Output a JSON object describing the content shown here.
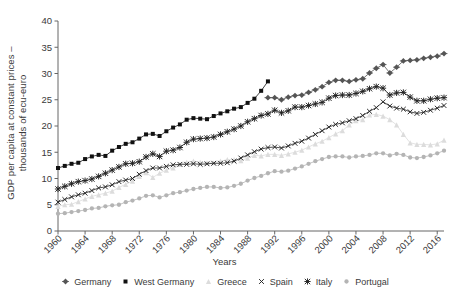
{
  "chart_data": {
    "type": "line",
    "title": "",
    "xlabel": "Years",
    "ylabel": "GDP per capita at constant prices – thousands of ecu-euro",
    "ylabel_line1": "GDP per capita at constant prices –",
    "ylabel_line2": "thousands of ecu-euro",
    "xlim": [
      1960,
      2017
    ],
    "ylim": [
      0,
      40
    ],
    "yticks": [
      0,
      5,
      10,
      15,
      20,
      25,
      30,
      35,
      40
    ],
    "xticks": [
      1960,
      1964,
      1968,
      1972,
      1976,
      1980,
      1984,
      1988,
      1992,
      1996,
      2000,
      2004,
      2008,
      2012,
      2016
    ],
    "grid": false,
    "legend_position": "bottom",
    "x": [
      1960,
      1961,
      1962,
      1963,
      1964,
      1965,
      1966,
      1967,
      1968,
      1969,
      1970,
      1971,
      1972,
      1973,
      1974,
      1975,
      1976,
      1977,
      1978,
      1979,
      1980,
      1981,
      1982,
      1983,
      1984,
      1985,
      1986,
      1987,
      1988,
      1989,
      1990,
      1991,
      1992,
      1993,
      1994,
      1995,
      1996,
      1997,
      1998,
      1999,
      2000,
      2001,
      2002,
      2003,
      2004,
      2005,
      2006,
      2007,
      2008,
      2009,
      2010,
      2011,
      2012,
      2013,
      2014,
      2015,
      2016,
      2017
    ],
    "series": [
      {
        "name": "Germany",
        "color": "#555555",
        "marker": "diamond",
        "x": [
          1991,
          1992,
          1993,
          1994,
          1995,
          1996,
          1997,
          1998,
          1999,
          2000,
          2001,
          2002,
          2003,
          2004,
          2005,
          2006,
          2007,
          2008,
          2009,
          2010,
          2011,
          2012,
          2013,
          2014,
          2015,
          2016,
          2017
        ],
        "values": [
          25.4,
          25.4,
          25.0,
          25.5,
          25.8,
          25.9,
          26.4,
          26.9,
          27.5,
          28.3,
          28.7,
          28.7,
          28.5,
          28.8,
          29.0,
          30.1,
          31.0,
          31.7,
          30.1,
          31.2,
          32.4,
          32.5,
          32.6,
          32.9,
          33.1,
          33.3,
          33.8
        ]
      },
      {
        "name": "West Germany",
        "color": "#111111",
        "marker": "square",
        "x": [
          1960,
          1961,
          1962,
          1963,
          1964,
          1965,
          1966,
          1967,
          1968,
          1969,
          1970,
          1971,
          1972,
          1973,
          1974,
          1975,
          1976,
          1977,
          1978,
          1979,
          1980,
          1981,
          1982,
          1983,
          1984,
          1985,
          1986,
          1987,
          1988,
          1989,
          1990,
          1991
        ],
        "values": [
          12.0,
          12.4,
          12.8,
          13.0,
          13.7,
          14.2,
          14.5,
          14.3,
          15.3,
          16.0,
          16.6,
          16.9,
          17.6,
          18.4,
          18.5,
          18.1,
          19.0,
          19.7,
          20.3,
          21.2,
          21.5,
          21.4,
          21.3,
          21.9,
          22.4,
          22.8,
          23.3,
          23.6,
          24.4,
          25.2,
          26.7,
          28.5
        ]
      },
      {
        "name": "Greece",
        "color": "#dcdcdc",
        "marker": "triangle",
        "x": [
          1960,
          1961,
          1962,
          1963,
          1964,
          1965,
          1966,
          1967,
          1968,
          1969,
          1970,
          1971,
          1972,
          1973,
          1974,
          1975,
          1976,
          1977,
          1978,
          1979,
          1980,
          1981,
          1982,
          1983,
          1984,
          1985,
          1986,
          1987,
          1988,
          1989,
          1990,
          1991,
          1992,
          1993,
          1994,
          1995,
          1996,
          1997,
          1998,
          1999,
          2000,
          2001,
          2002,
          2003,
          2004,
          2005,
          2006,
          2007,
          2008,
          2009,
          2010,
          2011,
          2012,
          2013,
          2014,
          2015,
          2016,
          2017
        ],
        "values": [
          4.7,
          5.0,
          5.1,
          5.6,
          6.1,
          6.6,
          6.9,
          7.2,
          7.6,
          8.3,
          8.9,
          9.5,
          10.4,
          11.1,
          10.2,
          11.0,
          11.6,
          12.0,
          12.7,
          13.1,
          13.3,
          13.1,
          13.0,
          13.0,
          13.3,
          13.6,
          13.6,
          13.4,
          13.9,
          14.4,
          14.3,
          14.6,
          14.6,
          14.4,
          14.7,
          15.0,
          15.4,
          16.0,
          16.6,
          17.1,
          17.8,
          18.5,
          19.1,
          20.2,
          21.0,
          21.2,
          22.1,
          22.2,
          21.9,
          21.2,
          20.2,
          18.4,
          16.8,
          16.5,
          16.5,
          16.4,
          16.6,
          17.3
        ]
      },
      {
        "name": "Spain",
        "color": "#222222",
        "marker": "x",
        "x": [
          1960,
          1961,
          1962,
          1963,
          1964,
          1965,
          1966,
          1967,
          1968,
          1969,
          1970,
          1971,
          1972,
          1973,
          1974,
          1975,
          1976,
          1977,
          1978,
          1979,
          1980,
          1981,
          1982,
          1983,
          1984,
          1985,
          1986,
          1987,
          1988,
          1989,
          1990,
          1991,
          1992,
          1993,
          1994,
          1995,
          1996,
          1997,
          1998,
          1999,
          2000,
          2001,
          2002,
          2003,
          2004,
          2005,
          2006,
          2007,
          2008,
          2009,
          2010,
          2011,
          2012,
          2013,
          2014,
          2015,
          2016,
          2017
        ],
        "values": [
          5.5,
          6.0,
          6.5,
          6.9,
          7.2,
          7.7,
          8.2,
          8.4,
          8.8,
          9.4,
          9.7,
          10.0,
          10.8,
          11.5,
          12.0,
          12.0,
          12.3,
          12.6,
          12.7,
          12.7,
          12.8,
          12.7,
          12.8,
          12.9,
          12.9,
          13.0,
          13.3,
          13.9,
          14.5,
          15.1,
          15.6,
          15.9,
          16.0,
          15.8,
          16.2,
          16.7,
          17.1,
          17.7,
          18.4,
          19.1,
          19.8,
          20.3,
          20.6,
          21.0,
          21.4,
          22.0,
          22.8,
          23.5,
          24.6,
          23.8,
          23.4,
          23.2,
          22.7,
          22.4,
          22.6,
          23.0,
          23.4,
          23.9
        ]
      },
      {
        "name": "Italy",
        "color": "#222222",
        "marker": "star",
        "x": [
          1960,
          1961,
          1962,
          1963,
          1964,
          1965,
          1966,
          1967,
          1968,
          1969,
          1970,
          1971,
          1972,
          1973,
          1974,
          1975,
          1976,
          1977,
          1978,
          1979,
          1980,
          1981,
          1982,
          1983,
          1984,
          1985,
          1986,
          1987,
          1988,
          1989,
          1990,
          1991,
          1992,
          1993,
          1994,
          1995,
          1996,
          1997,
          1998,
          1999,
          2000,
          2001,
          2002,
          2003,
          2004,
          2005,
          2006,
          2007,
          2008,
          2009,
          2010,
          2011,
          2012,
          2013,
          2014,
          2015,
          2016,
          2017
        ],
        "values": [
          8.0,
          8.5,
          9.0,
          9.4,
          9.6,
          9.9,
          10.4,
          11.0,
          11.6,
          12.2,
          12.8,
          12.9,
          13.2,
          14.1,
          14.7,
          14.2,
          15.2,
          15.4,
          15.9,
          16.9,
          17.5,
          17.6,
          17.7,
          17.9,
          18.4,
          18.9,
          19.4,
          20.0,
          20.8,
          21.4,
          22.0,
          22.3,
          23.0,
          22.5,
          22.9,
          23.6,
          23.6,
          23.9,
          24.2,
          24.5,
          25.3,
          25.8,
          25.9,
          25.9,
          26.2,
          26.6,
          27.1,
          27.5,
          27.2,
          25.9,
          26.3,
          26.4,
          25.5,
          24.8,
          24.8,
          25.1,
          25.3,
          25.4
        ]
      },
      {
        "name": "Portugal",
        "color": "#b4b4b4",
        "marker": "circle",
        "x": [
          1960,
          1961,
          1962,
          1963,
          1964,
          1965,
          1966,
          1967,
          1968,
          1969,
          1970,
          1971,
          1972,
          1973,
          1974,
          1975,
          1976,
          1977,
          1978,
          1979,
          1980,
          1981,
          1982,
          1983,
          1984,
          1985,
          1986,
          1987,
          1988,
          1989,
          1990,
          1991,
          1992,
          1993,
          1994,
          1995,
          1996,
          1997,
          1998,
          1999,
          2000,
          2001,
          2002,
          2003,
          2004,
          2005,
          2006,
          2007,
          2008,
          2009,
          2010,
          2011,
          2012,
          2013,
          2014,
          2015,
          2016,
          2017
        ],
        "values": [
          3.3,
          3.4,
          3.6,
          3.8,
          4.0,
          4.3,
          4.4,
          4.7,
          4.9,
          5.0,
          5.5,
          5.8,
          6.2,
          6.7,
          6.8,
          6.4,
          6.8,
          7.2,
          7.4,
          7.7,
          8.0,
          8.2,
          8.4,
          8.4,
          8.2,
          8.3,
          8.6,
          9.0,
          9.6,
          10.1,
          10.5,
          11.0,
          11.4,
          11.3,
          11.5,
          11.9,
          12.3,
          12.8,
          13.3,
          13.7,
          14.1,
          14.2,
          14.2,
          14.0,
          14.2,
          14.3,
          14.5,
          14.8,
          14.8,
          14.4,
          14.7,
          14.5,
          14.0,
          13.9,
          14.1,
          14.4,
          14.8,
          15.3
        ]
      }
    ]
  },
  "axis": {
    "ylabel_line1": "GDP per capita at constant prices –",
    "ylabel_line2": "thousands of ecu-euro",
    "xlabel": "Years",
    "ytick_labels": [
      "0",
      "5",
      "10",
      "15",
      "20",
      "25",
      "30",
      "35",
      "40"
    ],
    "xtick_labels": [
      "1960",
      "1964",
      "1968",
      "1972",
      "1976",
      "1980",
      "1984",
      "1988",
      "1992",
      "1996",
      "2000",
      "2004",
      "2008",
      "2012",
      "2016"
    ]
  },
  "legend": {
    "items": [
      {
        "label": "Germany",
        "marker": "diamond",
        "color": "#555555"
      },
      {
        "label": "West Germany",
        "marker": "square",
        "color": "#111111"
      },
      {
        "label": "Greece",
        "marker": "triangle",
        "color": "#dcdcdc"
      },
      {
        "label": "Spain",
        "marker": "x",
        "color": "#222222"
      },
      {
        "label": "Italy",
        "marker": "star",
        "color": "#222222"
      },
      {
        "label": "Portugal",
        "marker": "circle",
        "color": "#b4b4b4"
      }
    ]
  }
}
